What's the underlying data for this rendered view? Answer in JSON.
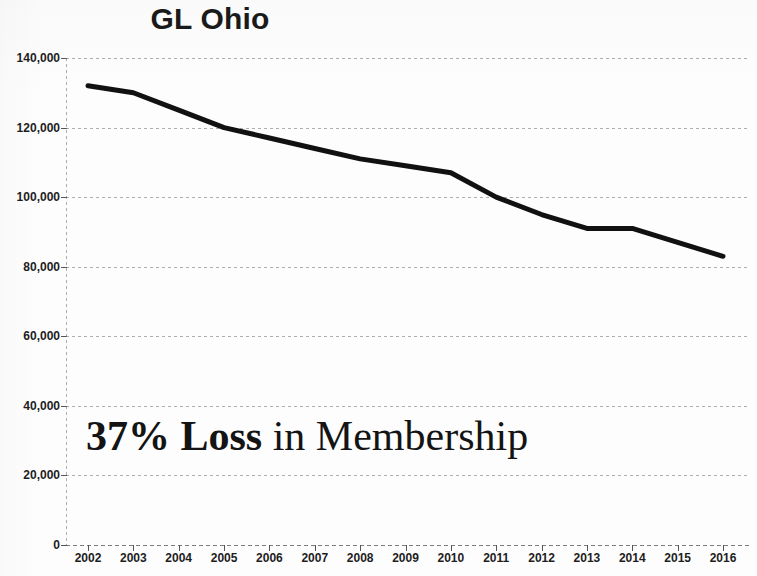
{
  "chart_data": {
    "type": "line",
    "title": "GL Ohio",
    "xlabel": "",
    "ylabel": "",
    "categories": [
      2002,
      2003,
      2004,
      2005,
      2006,
      2007,
      2008,
      2009,
      2010,
      2011,
      2012,
      2013,
      2014,
      2015,
      2016
    ],
    "x_tick_labels": [
      "2002",
      "2003",
      "2004",
      "2005",
      "2006",
      "2007",
      "2008",
      "2009",
      "2010",
      "2011",
      "2012",
      "2013",
      "2014",
      "2015",
      "2016"
    ],
    "values": [
      132000,
      130000,
      125000,
      120000,
      117000,
      114000,
      111000,
      109000,
      107000,
      100000,
      95000,
      91000,
      91000,
      87000,
      83000
    ],
    "series": [
      {
        "name": "GL Ohio membership",
        "values": [
          132000,
          130000,
          125000,
          120000,
          117000,
          114000,
          111000,
          109000,
          107000,
          100000,
          95000,
          91000,
          91000,
          87000,
          83000
        ],
        "color": "#111111"
      }
    ],
    "ylim": [
      0,
      140000
    ],
    "y_ticks": [
      0,
      20000,
      40000,
      60000,
      80000,
      100000,
      120000,
      140000
    ],
    "y_tick_labels": [
      "0",
      "20,000",
      "40,000",
      "60,000",
      "80,000",
      "100,000",
      "120,000",
      "140,000"
    ],
    "grid": true,
    "grid_style": "dotted-horizontal",
    "legend": false,
    "legend_position": "none",
    "line_width_px": 5,
    "annotations": [
      {
        "id": "loss-callout",
        "strong_text": "37% Loss",
        "normal_text": " in Membership",
        "full_text": "37% Loss in Membership"
      }
    ]
  },
  "colors": {
    "series_line": "#111111",
    "text": "#1d1d1d",
    "gridline": "#6e6e6e",
    "background": "#fdfdfd"
  }
}
